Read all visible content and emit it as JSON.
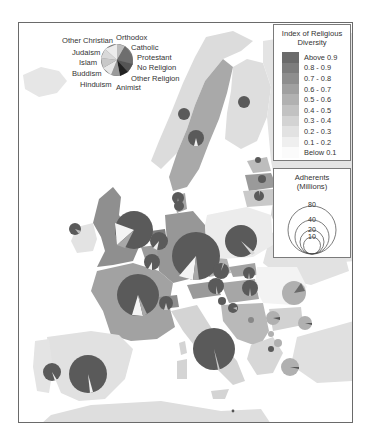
{
  "pie_key": {
    "labels_left": [
      "Other Christian",
      "Judaism",
      "Islam",
      "Buddism",
      "Hinduism"
    ],
    "labels_right": [
      "Orthodox",
      "Catholic",
      "Protestant",
      "No Religion",
      "Other Religion",
      "Animist"
    ]
  },
  "diversity_legend": {
    "title_line1": "Index of Religious",
    "title_line2": "Diversity",
    "items": [
      {
        "label": "Above 0.9",
        "color": "#6b6b6b"
      },
      {
        "label": "0.8 - 0.9",
        "color": "#7d7d7d"
      },
      {
        "label": "0.7 - 0.8",
        "color": "#8e8e8e"
      },
      {
        "label": "0.6 - 0.7",
        "color": "#a0a0a0"
      },
      {
        "label": "0.5 - 0.6",
        "color": "#b1b1b1"
      },
      {
        "label": "0.4 - 0.5",
        "color": "#c2c2c2"
      },
      {
        "label": "0.3 - 0.4",
        "color": "#d3d3d3"
      },
      {
        "label": "0.2 - 0.3",
        "color": "#e2e2e2"
      },
      {
        "label": "0.1 - 0.2",
        "color": "#efefef"
      },
      {
        "label": "Below 0.1",
        "color": "#fbfbfb"
      }
    ]
  },
  "adherents_legend": {
    "title_line1": "Adherents",
    "title_line2": "(Millions)",
    "values": [
      "80",
      "40",
      "20",
      "10"
    ]
  },
  "colors": {
    "sea": "#ffffff",
    "pie_main": "#5a5a5a",
    "pie_alt": "#a8a8a8",
    "pie_light": "#f0f0f0",
    "border": "#6a6a6a"
  }
}
